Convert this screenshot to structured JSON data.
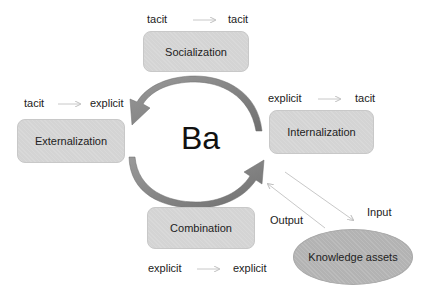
{
  "center_label": "Ba",
  "quadrants": {
    "socialization": {
      "label": "Socialization",
      "from": "tacit",
      "to": "tacit"
    },
    "externalization": {
      "label": "Externalization",
      "from": "tacit",
      "to": "explicit"
    },
    "internalization": {
      "label": "Internalization",
      "from": "explicit",
      "to": "tacit"
    },
    "combination": {
      "label": "Combination",
      "from": "explicit",
      "to": "explicit"
    }
  },
  "knowledge_assets": {
    "label": "Knowledge assets",
    "input_label": "Input",
    "output_label": "Output"
  },
  "colors": {
    "box_fill": "#d4d4d4",
    "ellipse_fill": "#b3b3b3",
    "cycle_arrow": "#8a8a8a",
    "thin_arrow": "#c8c8c8"
  }
}
